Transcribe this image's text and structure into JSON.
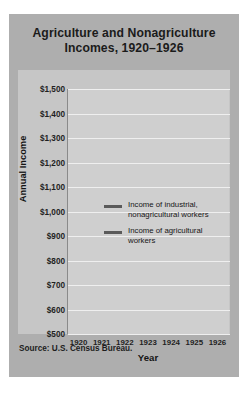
{
  "title": "Agriculture and Nonagriculture Incomes, 1920–1926",
  "source": "Source: U.S. Census Bureau.",
  "axis": {
    "ylabel": "Annual Income",
    "xlabel": "Year"
  },
  "legend": [
    {
      "label": "Income of industrial, nonagricultural workers",
      "color": "#5a5a5a"
    },
    {
      "label": "Income of agricultural workers",
      "color": "#5a5a5a"
    }
  ],
  "colors": {
    "card": "#aeaeae",
    "panel": "#c6c6c6",
    "plot": "#cfcfcf",
    "gridline": "#efefef",
    "line": "#5a5a5a",
    "text": "#1b1b1b"
  },
  "chart_data": {
    "type": "line",
    "title": "Agriculture and Nonagriculture Incomes, 1920–1926",
    "xlabel": "Year",
    "ylabel": "Annual Income",
    "categories": [
      "1920",
      "1921",
      "1922",
      "1923",
      "1924",
      "1925",
      "1926"
    ],
    "ytick_labels": [
      "$1,500",
      "$1,400",
      "$1,300",
      "$1,200",
      "$1,100",
      "$1,000",
      "$900",
      "$800",
      "$700",
      "$600",
      "$500"
    ],
    "ytick_values": [
      1500,
      1400,
      1300,
      1200,
      1100,
      1000,
      900,
      800,
      700,
      600,
      500
    ],
    "ylim": [
      500,
      1500
    ],
    "grid": true,
    "legend_position": "center-right-inside",
    "series": [
      {
        "name": "Income of industrial, nonagricultural workers",
        "values": [
          1500,
          1380,
          1310,
          1400,
          1405,
          1440,
          1480
        ]
      },
      {
        "name": "Income of agricultural workers",
        "values": [
          800,
          520,
          510,
          580,
          585,
          590,
          600
        ]
      }
    ]
  }
}
